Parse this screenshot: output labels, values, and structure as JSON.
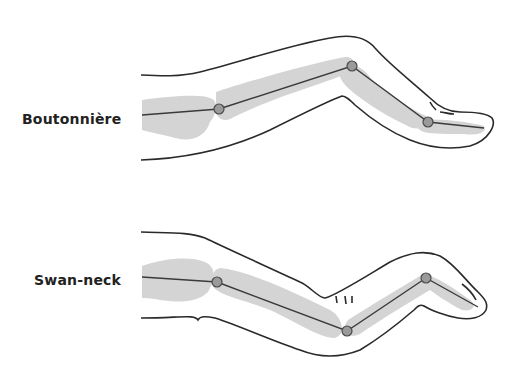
{
  "figure": {
    "panels": [
      {
        "label": "Boutonnière"
      },
      {
        "label": "Swan-neck"
      }
    ]
  },
  "colors": {
    "outline": "#2a2a2a",
    "bone": "#d4d4d4",
    "joint_fill": "#9a9a9a",
    "background": "#ffffff"
  }
}
